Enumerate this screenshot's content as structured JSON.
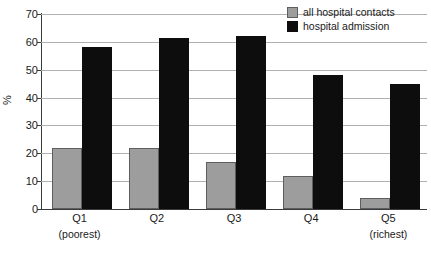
{
  "chart_data": {
    "type": "bar",
    "title": "",
    "xlabel": "",
    "ylabel": "%",
    "ylim": [
      0,
      70
    ],
    "ytick_step": 10,
    "yticks": [
      0,
      10,
      20,
      30,
      40,
      50,
      60,
      70
    ],
    "grid": true,
    "legend_position": "top-right",
    "categories": [
      "Q1",
      "Q2",
      "Q3",
      "Q4",
      "Q5"
    ],
    "category_sublabels": [
      "(poorest)",
      "",
      "",
      "",
      "(richest)"
    ],
    "series": [
      {
        "name": "all hospital contacts",
        "color": "#9d9d9d",
        "values": [
          22,
          22,
          17,
          12,
          4
        ]
      },
      {
        "name": "hospital admission",
        "color": "#0d0d0d",
        "values": [
          58,
          61.5,
          62,
          48,
          45
        ]
      }
    ]
  },
  "axis": {
    "y_label": "%",
    "y_tick_labels": [
      "70",
      "60",
      "50",
      "40",
      "30",
      "20",
      "10",
      "0"
    ]
  },
  "legend": {
    "items": [
      {
        "label": "all hospital contacts",
        "swatch": "gray-square-icon"
      },
      {
        "label": "hospital admission",
        "swatch": "black-square-icon"
      }
    ]
  },
  "x_axis": {
    "groups": [
      {
        "label": "Q1",
        "sublabel": "(poorest)"
      },
      {
        "label": "Q2",
        "sublabel": ""
      },
      {
        "label": "Q3",
        "sublabel": ""
      },
      {
        "label": "Q4",
        "sublabel": ""
      },
      {
        "label": "Q5",
        "sublabel": "(richest)"
      }
    ]
  },
  "caption_strip": {
    "text": ""
  }
}
